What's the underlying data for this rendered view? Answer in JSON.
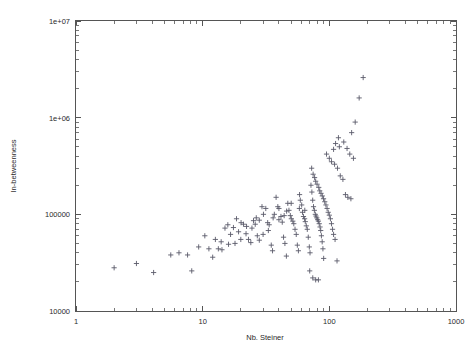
{
  "chart_data": {
    "type": "scatter",
    "title": "",
    "xlabel": "Nb. Steiner",
    "ylabel": "In-betweenness",
    "xscale": "log",
    "yscale": "log",
    "xlim": [
      1,
      1000
    ],
    "ylim": [
      10000,
      10000000
    ],
    "grid": false,
    "legend": null,
    "marker": "plus",
    "marker_color": "#5a5a6a",
    "xticks": [
      {
        "value": 1,
        "label": "1"
      },
      {
        "value": 10,
        "label": "10"
      },
      {
        "value": 100,
        "label": "100"
      },
      {
        "value": 1000,
        "label": "1000"
      }
    ],
    "yticks": [
      {
        "value": 10000,
        "label": "10000"
      },
      {
        "value": 100000,
        "label": "100000"
      },
      {
        "value": 1000000,
        "label": "1e+06"
      },
      {
        "value": 10000000,
        "label": "1e+07"
      }
    ],
    "series": [
      {
        "name": "steiner-betweenness",
        "points": [
          [
            2.0,
            28000
          ],
          [
            3.0,
            31000
          ],
          [
            4.1,
            25000
          ],
          [
            5.6,
            38000
          ],
          [
            6.5,
            40000
          ],
          [
            7.6,
            38000
          ],
          [
            8.2,
            26000
          ],
          [
            9.3,
            46000
          ],
          [
            10.4,
            60000
          ],
          [
            11.2,
            44000
          ],
          [
            12.0,
            36000
          ],
          [
            12.6,
            55000
          ],
          [
            13.3,
            44000
          ],
          [
            14.2,
            43000
          ],
          [
            15.0,
            72000
          ],
          [
            15.8,
            78000
          ],
          [
            16.6,
            62000
          ],
          [
            17.5,
            73000
          ],
          [
            18.5,
            90000
          ],
          [
            19.2,
            66000
          ],
          [
            20.1,
            82000
          ],
          [
            21.0,
            79000
          ],
          [
            22.2,
            75000
          ],
          [
            23.0,
            55000
          ],
          [
            24.0,
            51000
          ],
          [
            25.2,
            86000
          ],
          [
            26.0,
            79000
          ],
          [
            27.0,
            60000
          ],
          [
            28.0,
            54000
          ],
          [
            29.4,
            120000
          ],
          [
            30.2,
            100000
          ],
          [
            31.5,
            115000
          ],
          [
            32.6,
            82000
          ],
          [
            33.5,
            78000
          ],
          [
            34.8,
            48000
          ],
          [
            35.6,
            42000
          ],
          [
            36.8,
            100000
          ],
          [
            38.0,
            150000
          ],
          [
            39.2,
            120000
          ],
          [
            40.0,
            88000
          ],
          [
            41.5,
            95000
          ],
          [
            42.5,
            83000
          ],
          [
            43.5,
            58000
          ],
          [
            44.6,
            50000
          ],
          [
            45.8,
            37000
          ],
          [
            47.0,
            130000
          ],
          [
            48.0,
            110000
          ],
          [
            49.2,
            97000
          ],
          [
            50.1,
            90000
          ],
          [
            51.5,
            85000
          ],
          [
            52.4,
            80000
          ],
          [
            53.6,
            70000
          ],
          [
            54.8,
            62000
          ],
          [
            55.9,
            48000
          ],
          [
            57.0,
            42000
          ],
          [
            58.2,
            160000
          ],
          [
            59.0,
            140000
          ],
          [
            60.5,
            125000
          ],
          [
            61.4,
            105000
          ],
          [
            62.5,
            95000
          ],
          [
            63.8,
            90000
          ],
          [
            64.6,
            84000
          ],
          [
            65.8,
            76000
          ],
          [
            67.0,
            70000
          ],
          [
            68.2,
            58000
          ],
          [
            69.5,
            46000
          ],
          [
            70.4,
            40000
          ],
          [
            71.6,
            200000
          ],
          [
            72.8,
            170000
          ],
          [
            73.9,
            140000
          ],
          [
            75.0,
            120000
          ],
          [
            76.2,
            110000
          ],
          [
            77.5,
            100000
          ],
          [
            78.5,
            96000
          ],
          [
            79.6,
            92000
          ],
          [
            80.8,
            88000
          ],
          [
            82.0,
            85000
          ],
          [
            83.2,
            80000
          ],
          [
            84.5,
            74000
          ],
          [
            85.5,
            68000
          ],
          [
            86.6,
            60000
          ],
          [
            87.8,
            52000
          ],
          [
            89.0,
            44000
          ],
          [
            90.2,
            35000
          ],
          [
            70.0,
            26000
          ],
          [
            74.0,
            22000
          ],
          [
            78.0,
            21000
          ],
          [
            82.0,
            21000
          ],
          [
            72.5,
            300000
          ],
          [
            74.5,
            260000
          ],
          [
            76.5,
            240000
          ],
          [
            78.0,
            220000
          ],
          [
            80.0,
            205000
          ],
          [
            82.5,
            190000
          ],
          [
            84.0,
            175000
          ],
          [
            86.0,
            165000
          ],
          [
            88.0,
            155000
          ],
          [
            90.0,
            145000
          ],
          [
            92.0,
            135000
          ],
          [
            94.0,
            125000
          ],
          [
            96.0,
            115000
          ],
          [
            98.0,
            105000
          ],
          [
            100.0,
            98000
          ],
          [
            102.0,
            90000
          ],
          [
            104.0,
            80000
          ],
          [
            106.0,
            70000
          ],
          [
            108.0,
            62000
          ],
          [
            111.0,
            55000
          ],
          [
            115.0,
            33000
          ],
          [
            95.0,
            420000
          ],
          [
            100.0,
            380000
          ],
          [
            104.0,
            350000
          ],
          [
            110.0,
            330000
          ],
          [
            116.0,
            300000
          ],
          [
            122.0,
            250000
          ],
          [
            128.0,
            230000
          ],
          [
            134.0,
            160000
          ],
          [
            140.0,
            150000
          ],
          [
            148.0,
            145000
          ],
          [
            120.0,
            500000
          ],
          [
            130.0,
            560000
          ],
          [
            138.0,
            480000
          ],
          [
            150.0,
            700000
          ],
          [
            160.0,
            900000
          ],
          [
            172.0,
            1600000
          ],
          [
            185.0,
            2600000
          ],
          [
            145.0,
            420000
          ],
          [
            155.0,
            380000
          ],
          [
            118.0,
            620000
          ],
          [
            112.0,
            540000
          ],
          [
            108.0,
            470000
          ],
          [
            64.0,
            110000
          ],
          [
            58.0,
            115000
          ],
          [
            50.0,
            130000
          ],
          [
            46.0,
            108000
          ],
          [
            44.0,
            97000
          ],
          [
            40.0,
            115000
          ],
          [
            36.0,
            92000
          ],
          [
            33.0,
            68000
          ],
          [
            30.0,
            62000
          ],
          [
            28.0,
            87000
          ],
          [
            26.5,
            92000
          ],
          [
            24.5,
            72000
          ],
          [
            22.0,
            63000
          ],
          [
            20.0,
            55000
          ],
          [
            18.0,
            50000
          ],
          [
            16.0,
            49000
          ],
          [
            14.0,
            52000
          ]
        ]
      }
    ]
  },
  "axes": {
    "x_title": "Nb. Steiner",
    "y_title": "In-betweenness"
  }
}
